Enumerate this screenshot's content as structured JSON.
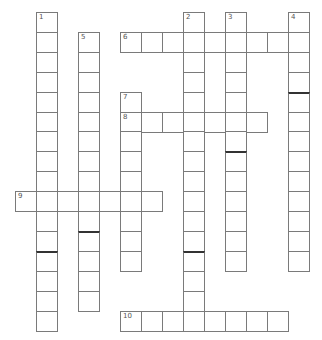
{
  "puzzle": {
    "type": "crossword",
    "cell_width": 21,
    "cell_height": 19.9,
    "origin_x": 15,
    "origin_y": 12,
    "border_color": "#7a7a7a",
    "thick_color": "#333333",
    "number_color": "#555555",
    "entries": [
      {
        "number": "1",
        "direction": "down",
        "row": 0,
        "col": 1,
        "length": 16
      },
      {
        "number": "2",
        "direction": "down",
        "row": 0,
        "col": 8,
        "length": 16
      },
      {
        "number": "3",
        "direction": "down",
        "row": 0,
        "col": 10,
        "length": 13
      },
      {
        "number": "4",
        "direction": "down",
        "row": 0,
        "col": 13,
        "length": 13
      },
      {
        "number": "5",
        "direction": "down",
        "row": 1,
        "col": 3,
        "length": 14
      },
      {
        "number": "6",
        "direction": "across",
        "row": 1,
        "col": 5,
        "length": 9
      },
      {
        "number": "7",
        "direction": "down",
        "row": 4,
        "col": 5,
        "length": 9
      },
      {
        "number": "8",
        "direction": "across",
        "row": 5,
        "col": 5,
        "length": 7
      },
      {
        "number": "9",
        "direction": "across",
        "row": 9,
        "col": 0,
        "length": 7
      },
      {
        "number": "10",
        "direction": "across",
        "row": 15,
        "col": 5,
        "length": 8
      }
    ],
    "thick_marks": [
      {
        "row": 12,
        "col": 1
      },
      {
        "row": 12,
        "col": 8
      },
      {
        "row": 11,
        "col": 3
      },
      {
        "row": 7,
        "col": 10
      },
      {
        "row": 4,
        "col": 13
      }
    ]
  }
}
